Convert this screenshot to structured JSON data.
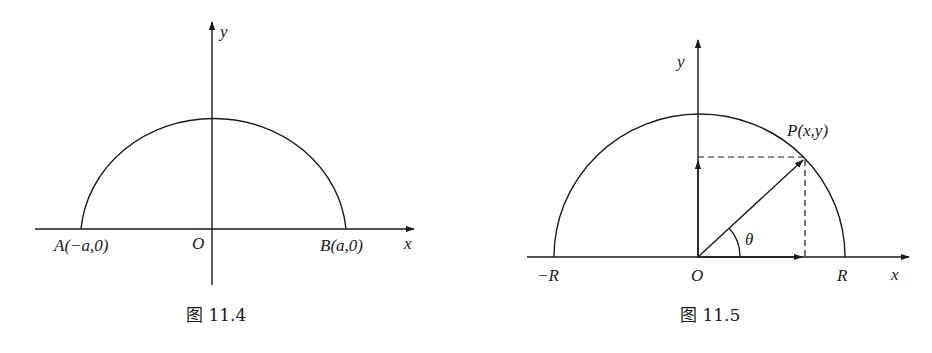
{
  "figures": [
    {
      "id": "fig-11-4",
      "caption": "图 11.4",
      "labels": {
        "y_axis": "y",
        "x_axis": "x",
        "origin": "O",
        "point_a": "A(−a,0)",
        "point_b": "B(a,0)"
      }
    },
    {
      "id": "fig-11-5",
      "caption": "图 11.5",
      "labels": {
        "y_axis": "y",
        "x_axis": "x",
        "origin": "O",
        "neg_r": "−R",
        "pos_r": "R",
        "point_p": "P(x,y)",
        "angle": "θ"
      }
    }
  ],
  "colors": {
    "stroke": "#1a1a1a",
    "background": "#ffffff"
  }
}
